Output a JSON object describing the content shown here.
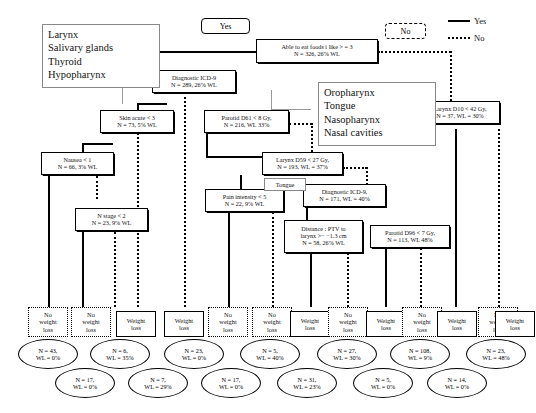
{
  "legend": {
    "yes_label": "Yes",
    "no_label": "No"
  },
  "pills": {
    "yes": "Yes",
    "no": "No"
  },
  "notes": {
    "left_group": "Larynx\nSalivary glands\nThyroid\nHypopharynx",
    "left_group_lines": [
      "Larynx",
      "Salivary glands",
      "Thyroid",
      "Hypopharynx"
    ],
    "right_group_lines": [
      "Oropharynx",
      "Tongue",
      "Nasopharynx",
      "Nasal cavities"
    ],
    "tongue": "Tongue"
  },
  "nodes": [
    {
      "id": "root",
      "l1": "Able to eat foods i like > = 3",
      "l2": "N = 326, 26% WL"
    },
    {
      "id": "icd9a",
      "l1": "Diagnostic ICD-9",
      "l2": "N = 289, 26% WL"
    },
    {
      "id": "skin",
      "l1": "Skin acute < 3",
      "l2": "N = 73, 5% WL"
    },
    {
      "id": "nausea",
      "l1": "Nausea < 1",
      "l2": "N = 66, 3% WL"
    },
    {
      "id": "nstage",
      "l1": "N stage < 2",
      "l2": "N = 23, 9% WL"
    },
    {
      "id": "parotid61",
      "l1": "Parotid D61 < 8 Gy,",
      "l2": "N = 216, WL 33%"
    },
    {
      "id": "larynx59",
      "l1": "Larynx D59 < 27 Gy,",
      "l2": "N = 193, WL = 37%"
    },
    {
      "id": "pain",
      "l1": "Pain intensity < 5",
      "l2": "N = 22, 9% WL"
    },
    {
      "id": "icd9b",
      "l1": "Diagnostic ICD-9,",
      "l2": "N = 171, WL = 40%"
    },
    {
      "id": "distance",
      "l1": "Distance : PTV to",
      "l2": "larynx >− −1.3 cm",
      "l3": "N = 58, 26% WL"
    },
    {
      "id": "parotid96",
      "l1": "Parotid D96 < 7 Gy,",
      "l2": "N = 113, WL 48%"
    },
    {
      "id": "larynx10",
      "l1": "Larynx D10 < 42 Gy,",
      "l2": "N = 37, WL = 30%"
    }
  ],
  "leaves": [
    {
      "i": 1,
      "kind": "no",
      "l1": "No",
      "l2": "weight",
      "l3": "loss"
    },
    {
      "i": 2,
      "kind": "no",
      "l1": "No",
      "l2": "weight",
      "l3": "loss"
    },
    {
      "i": 3,
      "kind": "yes",
      "l1": "Weight",
      "l2": "loss"
    },
    {
      "i": 4,
      "kind": "yes",
      "l1": "Weight",
      "l2": "loss"
    },
    {
      "i": 5,
      "kind": "no",
      "l1": "No",
      "l2": "weight",
      "l3": "loss"
    },
    {
      "i": 6,
      "kind": "no",
      "l1": "No",
      "l2": "weight",
      "l3": "loss"
    },
    {
      "i": 7,
      "kind": "yes",
      "l1": "Weight",
      "l2": "loss"
    },
    {
      "i": 8,
      "kind": "no",
      "l1": "No",
      "l2": "weight",
      "l3": "loss"
    },
    {
      "i": 9,
      "kind": "yes",
      "l1": "Weight",
      "l2": "loss"
    },
    {
      "i": 10,
      "kind": "no",
      "l1": "No",
      "l2": "weight",
      "l3": "loss"
    },
    {
      "i": 11,
      "kind": "yes",
      "l1": "Weight",
      "l2": "loss"
    },
    {
      "i": 12,
      "kind": "no",
      "l1": "No",
      "l2": "weight",
      "l3": "loss"
    },
    {
      "i": 13,
      "kind": "yes",
      "l1": "Weight",
      "l2": "loss"
    }
  ],
  "ovals": [
    {
      "i": 1,
      "l1": "N = 43,",
      "l2": "WL = 0%"
    },
    {
      "i": 2,
      "l1": "N = 17,",
      "l2": "WL = 0%"
    },
    {
      "i": 3,
      "l1": "N = 6,",
      "l2": "WL = 35%"
    },
    {
      "i": 4,
      "l1": "N = 7,",
      "l2": "WL = 29%"
    },
    {
      "i": 5,
      "l1": "N = 23,",
      "l2": "WL = 0%"
    },
    {
      "i": 6,
      "l1": "N = 17,",
      "l2": "WL = 0%"
    },
    {
      "i": 7,
      "l1": "N = 5,",
      "l2": "WL = 40%"
    },
    {
      "i": 8,
      "l1": "N = 31,",
      "l2": "WL = 23%"
    },
    {
      "i": 9,
      "l1": "N = 27,",
      "l2": "WL = 30%"
    },
    {
      "i": 10,
      "l1": "N = 5,",
      "l2": "WL = 0%"
    },
    {
      "i": 11,
      "l1": "N = 108,",
      "l2": "WL = 9%"
    },
    {
      "i": 12,
      "l1": "N = 14,",
      "l2": "WL = 0%"
    },
    {
      "i": 13,
      "l1": "N = 23,",
      "l2": "WL = 48%"
    }
  ]
}
